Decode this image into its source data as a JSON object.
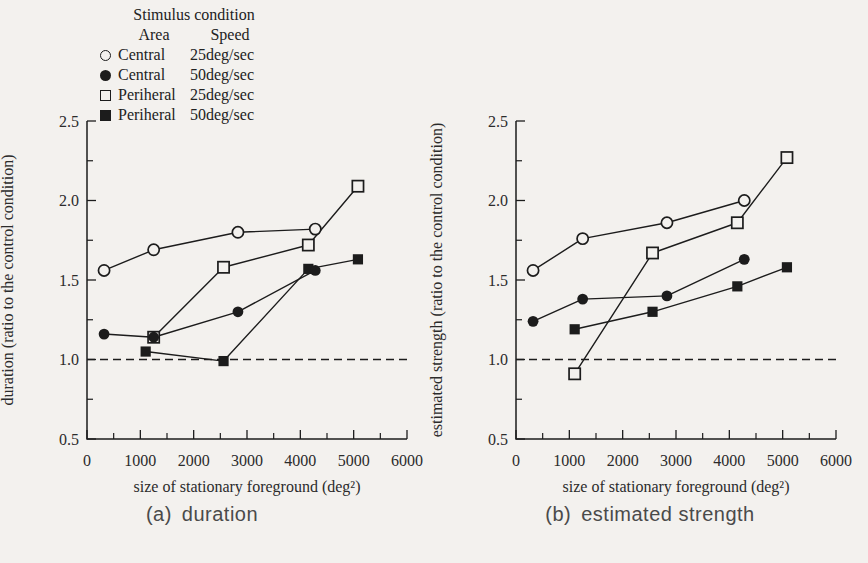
{
  "figure": {
    "background": "#f3f1ee",
    "ink": "#1c1c1c",
    "axis_text_color": "#2b2b2b",
    "caption_color": "#4a4a4a"
  },
  "legend": {
    "title": "Stimulus condition",
    "area_header": "Area",
    "speed_header": "Speed",
    "entries": [
      {
        "marker": "open-circle",
        "area": "Central",
        "speed": "25deg/sec"
      },
      {
        "marker": "filled-circle",
        "area": "Central",
        "speed": "50deg/sec"
      },
      {
        "marker": "open-square",
        "area": "Periheral",
        "speed": "25deg/sec"
      },
      {
        "marker": "filled-square",
        "area": "Periheral",
        "speed": "50deg/sec"
      }
    ]
  },
  "chart_data": [
    {
      "type": "line",
      "caption_prefix": "(a)",
      "caption_label": "duration",
      "xlabel": "size of stationary foreground (deg²)",
      "ylabel": "duration (ratio to the control condition)",
      "xlim": [
        0,
        6000
      ],
      "ylim": [
        0.5,
        2.5
      ],
      "xticks": [
        0,
        1000,
        2000,
        3000,
        4000,
        5000,
        6000
      ],
      "yticks": [
        "0.5",
        "1.0",
        "1.5",
        "2.0",
        "2.5"
      ],
      "x_minor_step": 500,
      "y_minor_step": 0.25,
      "reference_line_y": 1.0,
      "grid": "off",
      "series": [
        {
          "name": "Central 25deg/sec",
          "marker": "open-circle",
          "x": [
            320,
            1250,
            2830,
            4280
          ],
          "y": [
            1.56,
            1.69,
            1.8,
            1.82
          ]
        },
        {
          "name": "Periheral 25deg/sec",
          "marker": "open-square",
          "x": [
            1250,
            2560,
            4150,
            5080
          ],
          "y": [
            1.14,
            1.58,
            1.72,
            2.09
          ]
        },
        {
          "name": "Periheral 50deg/sec",
          "marker": "filled-square",
          "x": [
            1100,
            2560,
            4150,
            5080
          ],
          "y": [
            1.05,
            0.99,
            1.57,
            1.63
          ]
        },
        {
          "name": "Central 50deg/sec",
          "marker": "filled-circle",
          "x": [
            320,
            1250,
            2830,
            4280
          ],
          "y": [
            1.16,
            1.14,
            1.3,
            1.56
          ]
        }
      ]
    },
    {
      "type": "line",
      "caption_prefix": "(b)",
      "caption_label": "estimated strength",
      "xlabel": "size of stationary foreground (deg²)",
      "ylabel": "estimated strength (ratio to the control condition)",
      "xlim": [
        0,
        6000
      ],
      "ylim": [
        0.5,
        2.5
      ],
      "xticks": [
        0,
        1000,
        2000,
        3000,
        4000,
        5000,
        6000
      ],
      "yticks": [
        "0.5",
        "1.0",
        "1.5",
        "2.0",
        "2.5"
      ],
      "x_minor_step": 500,
      "y_minor_step": 0.25,
      "reference_line_y": 1.0,
      "grid": "off",
      "series": [
        {
          "name": "Central 25deg/sec",
          "marker": "open-circle",
          "x": [
            320,
            1250,
            2830,
            4280
          ],
          "y": [
            1.56,
            1.76,
            1.86,
            2.0
          ]
        },
        {
          "name": "Periheral 25deg/sec",
          "marker": "open-square",
          "x": [
            1100,
            2560,
            4150,
            5080
          ],
          "y": [
            0.91,
            1.67,
            1.86,
            2.27
          ]
        },
        {
          "name": "Periheral 50deg/sec",
          "marker": "filled-square",
          "x": [
            1100,
            2560,
            4150,
            5080
          ],
          "y": [
            1.19,
            1.3,
            1.46,
            1.58
          ]
        },
        {
          "name": "Central 50deg/sec",
          "marker": "filled-circle",
          "x": [
            320,
            1250,
            2830,
            4280
          ],
          "y": [
            1.24,
            1.38,
            1.4,
            1.63
          ]
        }
      ]
    }
  ]
}
